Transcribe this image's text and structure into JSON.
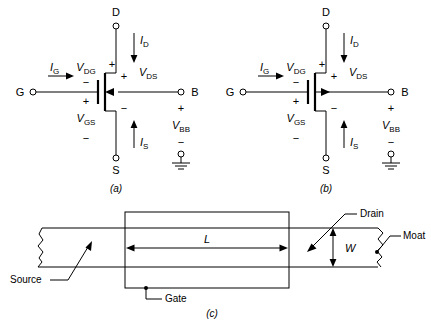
{
  "figure": {
    "panels": [
      {
        "id": "a",
        "label": "(a)",
        "device": "nmos",
        "body_arrow_direction": "inward",
        "terminals": {
          "drain": "D",
          "gate": "G",
          "source": "S",
          "body": "B"
        },
        "currents": {
          "gate": "I",
          "gate_sub": "G",
          "drain": "I",
          "drain_sub": "D",
          "source": "I",
          "source_sub": "S"
        },
        "voltages": {
          "dg": "V",
          "dg_sub": "DG",
          "gs": "V",
          "gs_sub": "GS",
          "ds": "V",
          "ds_sub": "DS",
          "bb": "V",
          "bb_sub": "BB"
        },
        "polarity_marks": {
          "dg_minus": "−",
          "gs_plus": "+",
          "gs_minus": "−",
          "ds_top_plus": "+",
          "ds_inner_plus": "+",
          "ds_minus": "−",
          "bb_plus": "+",
          "bb_minus": "−"
        },
        "ground": "ground-symbol"
      },
      {
        "id": "b",
        "label": "(b)",
        "device": "pmos",
        "body_arrow_direction": "outward",
        "terminals": {
          "drain": "D",
          "gate": "G",
          "source": "S",
          "body": "B"
        },
        "currents": {
          "gate": "I",
          "gate_sub": "G",
          "drain": "I",
          "drain_sub": "D",
          "source": "I",
          "source_sub": "S"
        },
        "voltages": {
          "dg": "V",
          "dg_sub": "DG",
          "gs": "V",
          "gs_sub": "GS",
          "ds": "V",
          "ds_sub": "DS",
          "bb": "V",
          "bb_sub": "BB"
        },
        "polarity_marks": {
          "dg_minus": "−",
          "gs_plus": "+",
          "gs_minus": "−",
          "ds_top_plus": "+",
          "ds_inner_plus": "+",
          "ds_minus": "−",
          "bb_plus": "+",
          "bb_minus": "−"
        },
        "ground": "ground-symbol"
      },
      {
        "id": "c",
        "label": "(c)",
        "view": "top-layout",
        "annotations": {
          "source": "Source",
          "drain": "Drain",
          "gate": "Gate",
          "moat": "Moat"
        },
        "dimensions": {
          "length": "L",
          "width": "W"
        }
      }
    ]
  },
  "colors": {
    "ink": "#000000",
    "background": "#ffffff"
  }
}
